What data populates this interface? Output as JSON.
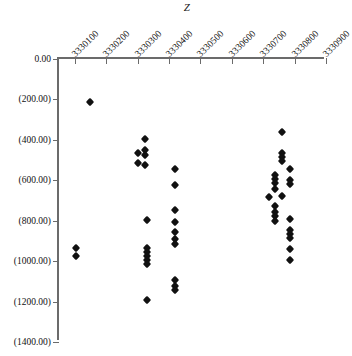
{
  "chart_data": {
    "type": "scatter",
    "title": "Z",
    "xlabel": "Z",
    "ylabel": "",
    "grid": false,
    "legend": null,
    "xlim": [
      3330050,
      3330900
    ],
    "ylim": [
      -1400,
      0
    ],
    "xticks": [
      3330100,
      3330200,
      3330300,
      3330400,
      3330500,
      3330600,
      3330700,
      3330800,
      3330900
    ],
    "xtick_labels": [
      "3330100",
      "3330200",
      "3330300",
      "3330400",
      "3330500",
      "3330600",
      "3330700",
      "3330800",
      "3330900"
    ],
    "yticks": [
      0,
      -200,
      -400,
      -600,
      -800,
      -1000,
      -1200,
      -1400
    ],
    "ytick_labels": [
      "0.00",
      "(200.00)",
      "(400.00)",
      "(600.00)",
      "(800.00)",
      "(1000.00)",
      "(1200.00)",
      "(1400.00)"
    ],
    "marker": "diamond",
    "marker_color": "#111111",
    "axis_color": "#6b6b6b",
    "series": [
      {
        "name": "data",
        "points": [
          [
            3330148,
            -215
          ],
          [
            3330105,
            -935
          ],
          [
            3330105,
            -975
          ],
          [
            3330300,
            -465
          ],
          [
            3330300,
            -515
          ],
          [
            3330323,
            -395
          ],
          [
            3330323,
            -450
          ],
          [
            3330323,
            -475
          ],
          [
            3330323,
            -525
          ],
          [
            3330330,
            -795
          ],
          [
            3330330,
            -935
          ],
          [
            3330330,
            -955
          ],
          [
            3330330,
            -975
          ],
          [
            3330330,
            -995
          ],
          [
            3330330,
            -1015
          ],
          [
            3330330,
            -1190
          ],
          [
            3330420,
            -545
          ],
          [
            3330420,
            -625
          ],
          [
            3330420,
            -745
          ],
          [
            3330420,
            -805
          ],
          [
            3330420,
            -855
          ],
          [
            3330420,
            -890
          ],
          [
            3330420,
            -915
          ],
          [
            3330420,
            -1095
          ],
          [
            3330420,
            -1125
          ],
          [
            3330420,
            -1145
          ],
          [
            3330760,
            -360
          ],
          [
            3330760,
            -465
          ],
          [
            3330760,
            -485
          ],
          [
            3330760,
            -505
          ],
          [
            3330738,
            -575
          ],
          [
            3330738,
            -595
          ],
          [
            3330738,
            -615
          ],
          [
            3330738,
            -645
          ],
          [
            3330785,
            -545
          ],
          [
            3330785,
            -600
          ],
          [
            3330785,
            -620
          ],
          [
            3330718,
            -685
          ],
          [
            3330760,
            -680
          ],
          [
            3330738,
            -725
          ],
          [
            3330738,
            -755
          ],
          [
            3330738,
            -775
          ],
          [
            3330738,
            -800
          ],
          [
            3330785,
            -790
          ],
          [
            3330785,
            -845
          ],
          [
            3330785,
            -865
          ],
          [
            3330785,
            -885
          ],
          [
            3330785,
            -940
          ],
          [
            3330785,
            -995
          ]
        ]
      }
    ]
  }
}
